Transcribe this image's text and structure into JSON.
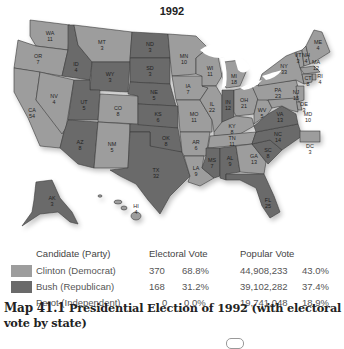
{
  "title": "1992",
  "colors": {
    "democrat": "#9d9d9d",
    "republican": "#6a6a6a",
    "independent": "#ffffff",
    "lakes": "#ffffff",
    "border": "#3a3a3a"
  },
  "map": {
    "states": [
      {
        "abbr": "WA",
        "ev": "11",
        "party": "D"
      },
      {
        "abbr": "OR",
        "ev": "7",
        "party": "D"
      },
      {
        "abbr": "CA",
        "ev": "54",
        "party": "D"
      },
      {
        "abbr": "NV",
        "ev": "4",
        "party": "D"
      },
      {
        "abbr": "ID",
        "ev": "4",
        "party": "R"
      },
      {
        "abbr": "MT",
        "ev": "3",
        "party": "D"
      },
      {
        "abbr": "WY",
        "ev": "3",
        "party": "R"
      },
      {
        "abbr": "UT",
        "ev": "5",
        "party": "R"
      },
      {
        "abbr": "CO",
        "ev": "8",
        "party": "D"
      },
      {
        "abbr": "AZ",
        "ev": "8",
        "party": "R"
      },
      {
        "abbr": "NM",
        "ev": "5",
        "party": "D"
      },
      {
        "abbr": "ND",
        "ev": "3",
        "party": "R"
      },
      {
        "abbr": "SD",
        "ev": "3",
        "party": "R"
      },
      {
        "abbr": "NE",
        "ev": "5",
        "party": "R"
      },
      {
        "abbr": "KS",
        "ev": "6",
        "party": "R"
      },
      {
        "abbr": "OK",
        "ev": "8",
        "party": "R"
      },
      {
        "abbr": "TX",
        "ev": "32",
        "party": "R"
      },
      {
        "abbr": "MN",
        "ev": "10",
        "party": "D"
      },
      {
        "abbr": "IA",
        "ev": "7",
        "party": "D"
      },
      {
        "abbr": "MO",
        "ev": "11",
        "party": "D"
      },
      {
        "abbr": "AR",
        "ev": "6",
        "party": "D"
      },
      {
        "abbr": "LA",
        "ev": "9",
        "party": "D"
      },
      {
        "abbr": "WI",
        "ev": "11",
        "party": "D"
      },
      {
        "abbr": "IL",
        "ev": "22",
        "party": "D"
      },
      {
        "abbr": "MI",
        "ev": "18",
        "party": "D"
      },
      {
        "abbr": "IN",
        "ev": "12",
        "party": "R"
      },
      {
        "abbr": "OH",
        "ev": "21",
        "party": "D"
      },
      {
        "abbr": "KY",
        "ev": "8",
        "party": "D"
      },
      {
        "abbr": "TN",
        "ev": "11",
        "party": "D"
      },
      {
        "abbr": "MS",
        "ev": "7",
        "party": "R"
      },
      {
        "abbr": "AL",
        "ev": "9",
        "party": "R"
      },
      {
        "abbr": "GA",
        "ev": "13",
        "party": "D"
      },
      {
        "abbr": "FL",
        "ev": "25",
        "party": "R"
      },
      {
        "abbr": "SC",
        "ev": "8",
        "party": "R"
      },
      {
        "abbr": "NC",
        "ev": "14",
        "party": "R"
      },
      {
        "abbr": "VA",
        "ev": "13",
        "party": "R"
      },
      {
        "abbr": "WV",
        "ev": "5",
        "party": "D"
      },
      {
        "abbr": "PA",
        "ev": "23",
        "party": "D"
      },
      {
        "abbr": "NY",
        "ev": "33",
        "party": "D"
      },
      {
        "abbr": "VT",
        "ev": "3",
        "party": "D"
      },
      {
        "abbr": "NH",
        "ev": "4",
        "party": "D"
      },
      {
        "abbr": "ME",
        "ev": "4",
        "party": "D"
      },
      {
        "abbr": "MA",
        "ev": "12",
        "party": "D"
      },
      {
        "abbr": "RI",
        "ev": "4",
        "party": "D"
      },
      {
        "abbr": "CT",
        "ev": "8",
        "party": "D"
      },
      {
        "abbr": "NJ",
        "ev": "15",
        "party": "D"
      },
      {
        "abbr": "DE",
        "ev": "3",
        "party": "D"
      },
      {
        "abbr": "MD",
        "ev": "10",
        "party": "D"
      },
      {
        "abbr": "DC",
        "ev": "3",
        "party": "D"
      },
      {
        "abbr": "AK",
        "ev": "3",
        "party": "R"
      },
      {
        "abbr": "HI",
        "ev": "4",
        "party": "D"
      }
    ]
  },
  "legend": {
    "headers": {
      "candidate": "Candidate (Party)",
      "electoral": "Electoral Vote",
      "popular": "Popular Vote"
    },
    "rows": [
      {
        "candidate": "Clinton (Democrat)",
        "ev": "370",
        "ev_pct": "68.8%",
        "pv": "44,908,233",
        "pv_pct": "43.0%",
        "swatch": "#9d9d9d"
      },
      {
        "candidate": "Bush (Republican)",
        "ev": "168",
        "ev_pct": "31.2%",
        "pv": "39,102,282",
        "pv_pct": "37.4%",
        "swatch": "#6a6a6a"
      },
      {
        "candidate": "Perot (Independent)",
        "ev": "0",
        "ev_pct": "0.0%",
        "pv": "19,741,048",
        "pv_pct": "18.9%",
        "swatch": ""
      }
    ]
  },
  "caption": {
    "number": "Map 41.1",
    "text": "Presidential Election of 1992 (with electoral vote by state)"
  }
}
